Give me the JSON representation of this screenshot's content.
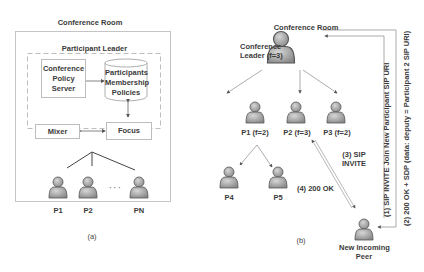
{
  "panel_a": {
    "title": "Conference Room",
    "leader_group": "Participant Leader",
    "boxes": {
      "policy_server": "Conference Policy Server",
      "membership": "Participants Membership Policies",
      "mixer": "Mixer",
      "focus": "Focus"
    },
    "participants": [
      "P1",
      "P2",
      "PN"
    ],
    "ellipsis": "· · ·",
    "caption": "(a)"
  },
  "panel_b": {
    "title": "Conference Room",
    "leader_label_line1": "Conference",
    "leader_label_line2": "Leader (f=3)",
    "participants": [
      {
        "label": "P1 (f=2)"
      },
      {
        "label": "P2 (f=3)"
      },
      {
        "label": "P3 (f=2)"
      },
      {
        "label": "P4"
      },
      {
        "label": "P5"
      }
    ],
    "messages": {
      "m1": "(1) SIP INVITE Join New Participant SIP URI",
      "m2": "(2) 200 OK + SDP (data: deputy = Participant 2 SIP URI)",
      "m3_line1": "(3) SIP",
      "m3_line2": "INVITE",
      "m4": "(4) 200 OK"
    },
    "new_peer_line1": "New Incoming",
    "new_peer_line2": "Peer",
    "caption": "(b)"
  },
  "colors": {
    "person_fill": "#a8a8a8",
    "person_stroke": "#555555",
    "box_border": "#bdbdbd",
    "arrow": "#777777"
  }
}
